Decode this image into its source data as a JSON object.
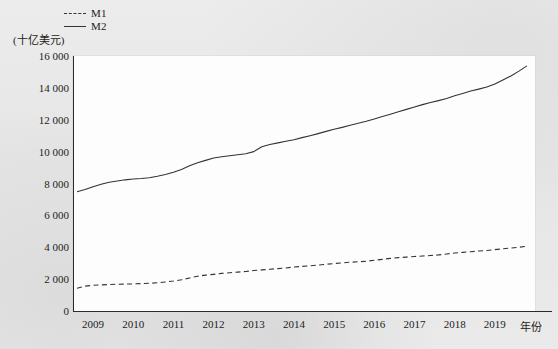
{
  "chart_data": {
    "type": "line",
    "title": "",
    "subtitle": "",
    "unit_label": "(十亿美元)",
    "xlabel": "年份",
    "ylabel": "",
    "grid": false,
    "legend_position": "top-left",
    "xlim": [
      2008.5,
      2020.0
    ],
    "ylim": [
      0,
      16000
    ],
    "yticks": [
      0,
      2000,
      4000,
      6000,
      8000,
      10000,
      12000,
      14000,
      16000
    ],
    "ytick_labels": [
      "0",
      "2 000",
      "4 000",
      "6 000",
      "8 000",
      "10 000",
      "12 000",
      "14 000",
      "16 000"
    ],
    "xticks": [
      2009,
      2010,
      2011,
      2012,
      2013,
      2014,
      2015,
      2016,
      2017,
      2018,
      2019
    ],
    "xtick_labels": [
      "2009",
      "2010",
      "2011",
      "2012",
      "2013",
      "2014",
      "2015",
      "2016",
      "2017",
      "2018",
      "2019"
    ],
    "x": [
      2008.6,
      2008.8,
      2009.0,
      2009.2,
      2009.4,
      2009.6,
      2009.8,
      2010.0,
      2010.2,
      2010.4,
      2010.6,
      2010.8,
      2011.0,
      2011.2,
      2011.4,
      2011.6,
      2011.8,
      2012.0,
      2012.2,
      2012.4,
      2012.6,
      2012.8,
      2013.0,
      2013.2,
      2013.4,
      2013.6,
      2013.8,
      2014.0,
      2014.2,
      2014.4,
      2014.6,
      2014.8,
      2015.0,
      2015.2,
      2015.4,
      2015.6,
      2015.8,
      2016.0,
      2016.2,
      2016.4,
      2016.6,
      2016.8,
      2017.0,
      2017.2,
      2017.4,
      2017.6,
      2017.8,
      2018.0,
      2018.2,
      2018.4,
      2018.6,
      2018.8,
      2019.0,
      2019.2,
      2019.4,
      2019.6,
      2019.8
    ],
    "series": [
      {
        "name": "M1",
        "style": "dashed",
        "color": "#333333",
        "values": [
          1430,
          1560,
          1610,
          1640,
          1660,
          1680,
          1690,
          1700,
          1720,
          1740,
          1770,
          1820,
          1880,
          1960,
          2070,
          2180,
          2250,
          2300,
          2360,
          2400,
          2440,
          2480,
          2540,
          2580,
          2620,
          2660,
          2700,
          2760,
          2800,
          2840,
          2880,
          2930,
          2980,
          3020,
          3060,
          3090,
          3120,
          3180,
          3240,
          3300,
          3350,
          3380,
          3420,
          3450,
          3480,
          3520,
          3580,
          3640,
          3680,
          3720,
          3760,
          3800,
          3850,
          3900,
          3950,
          4000,
          4060
        ]
      },
      {
        "name": "M2",
        "style": "solid",
        "color": "#333333",
        "values": [
          7480,
          7620,
          7800,
          7950,
          8080,
          8160,
          8230,
          8280,
          8310,
          8360,
          8450,
          8560,
          8700,
          8880,
          9120,
          9300,
          9450,
          9600,
          9680,
          9740,
          9800,
          9870,
          10000,
          10300,
          10450,
          10550,
          10650,
          10750,
          10880,
          11000,
          11130,
          11270,
          11400,
          11520,
          11650,
          11780,
          11900,
          12050,
          12200,
          12350,
          12500,
          12650,
          12800,
          12950,
          13080,
          13200,
          13330,
          13500,
          13650,
          13800,
          13920,
          14050,
          14250,
          14500,
          14750,
          15050,
          15380
        ]
      }
    ]
  },
  "legend": {
    "items": [
      {
        "label": "M1",
        "style": "dashed"
      },
      {
        "label": "M2",
        "style": "solid"
      }
    ]
  }
}
